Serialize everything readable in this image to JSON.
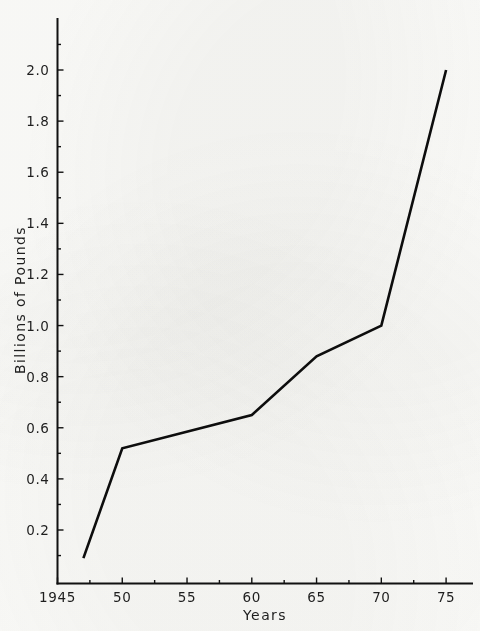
{
  "chart_data": {
    "type": "line",
    "title": "",
    "xlabel": "Years",
    "ylabel": "Billions of Pounds",
    "xlim": [
      1945,
      1977
    ],
    "ylim": [
      0,
      2.12
    ],
    "grid": false,
    "legend": null,
    "x_tick_labels": [
      "1945",
      "50",
      "55",
      "60",
      "65",
      "70",
      "75"
    ],
    "x_tick_values": [
      1945,
      1950,
      1955,
      1960,
      1965,
      1970,
      1975
    ],
    "x_minor_tick_values": [
      1947.5,
      1952.5,
      1957.5,
      1962.5,
      1967.5,
      1972.5
    ],
    "y_tick_labels": [
      "0.2",
      "0.4",
      "0.6",
      "0.8",
      "1.0",
      "1.2",
      "1.4",
      "1.6",
      "1.8",
      "2.0"
    ],
    "y_tick_values": [
      0.2,
      0.4,
      0.6,
      0.8,
      1.0,
      1.2,
      1.4,
      1.6,
      1.8,
      2.0
    ],
    "y_minor_tick_values": [
      0.1,
      0.3,
      0.5,
      0.7,
      0.9,
      1.1,
      1.3,
      1.5,
      1.7,
      1.9,
      2.1
    ],
    "series": [
      {
        "name": "",
        "color": "#0d0d0d",
        "x": [
          1947,
          1950,
          1960,
          1965,
          1970,
          1975
        ],
        "values": [
          0.09,
          0.52,
          0.65,
          0.88,
          1.0,
          2.0
        ]
      }
    ]
  },
  "axes": {
    "y_axis_title": "Billions of Pounds",
    "x_axis_title": "Years"
  }
}
